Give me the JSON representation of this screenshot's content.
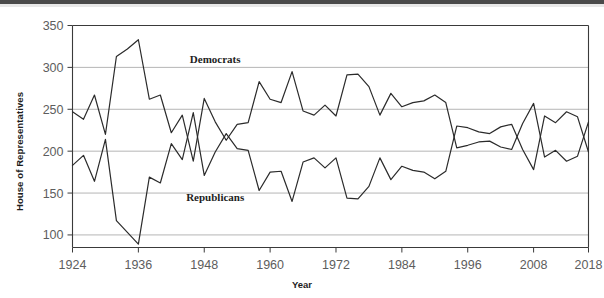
{
  "chart_data": {
    "type": "line",
    "title": "",
    "xlabel": "Year",
    "ylabel": "House of Representatives",
    "xlim": [
      1924,
      2018
    ],
    "ylim": [
      85,
      350
    ],
    "yticks": [
      100,
      150,
      200,
      250,
      300,
      350
    ],
    "ytick_labels": [
      "100",
      "150",
      "200",
      "250",
      "300",
      "350"
    ],
    "xticks": [
      1924,
      1936,
      1948,
      1960,
      1972,
      1984,
      1996,
      2008,
      2018
    ],
    "xtick_labels": [
      "1924",
      "1936",
      "1948",
      "1960",
      "1972",
      "1984",
      "1996",
      "2008",
      "2018"
    ],
    "grid": "horizontal",
    "legend_position": "inline-annotations",
    "x": [
      1924,
      1926,
      1928,
      1930,
      1932,
      1934,
      1936,
      1938,
      1940,
      1942,
      1944,
      1946,
      1948,
      1950,
      1952,
      1954,
      1956,
      1958,
      1960,
      1962,
      1964,
      1966,
      1968,
      1970,
      1972,
      1974,
      1976,
      1978,
      1980,
      1982,
      1984,
      1986,
      1988,
      1990,
      1992,
      1994,
      1996,
      1998,
      2000,
      2002,
      2004,
      2006,
      2008,
      2010,
      2012,
      2014,
      2016,
      2018
    ],
    "series": [
      {
        "name": "Democrats",
        "color": "#2b2b2b",
        "label_x": 1950,
        "label_y": 305,
        "values": [
          247,
          238,
          267,
          220,
          313,
          322,
          333,
          262,
          267,
          222,
          243,
          188,
          263,
          235,
          213,
          232,
          234,
          283,
          262,
          258,
          295,
          248,
          243,
          255,
          242,
          291,
          292,
          277,
          243,
          269,
          253,
          258,
          260,
          267,
          258,
          204,
          207,
          211,
          212,
          205,
          202,
          233,
          257,
          193,
          201,
          188,
          194,
          235
        ]
      },
      {
        "name": "Republicans",
        "color": "#2b2b2b",
        "label_x": 1950,
        "label_y": 140,
        "values": [
          183,
          195,
          164,
          214,
          117,
          103,
          89,
          169,
          162,
          209,
          190,
          246,
          171,
          199,
          221,
          203,
          201,
          153,
          175,
          176,
          140,
          187,
          192,
          180,
          192,
          144,
          143,
          158,
          192,
          166,
          182,
          177,
          175,
          167,
          176,
          230,
          228,
          223,
          221,
          229,
          232,
          202,
          178,
          242,
          234,
          247,
          241,
          199
        ]
      }
    ]
  },
  "annotations": {
    "democrats_label": "Democrats",
    "republicans_label": "Republicans"
  },
  "axes": {
    "y_title": "House of Representatives",
    "x_title": "Year"
  }
}
